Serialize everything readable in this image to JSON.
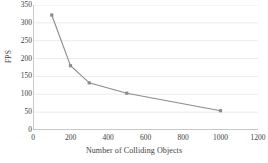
{
  "chart_data": {
    "type": "line",
    "title": "",
    "xlabel": "Number of Colliding Objects",
    "ylabel": "FPS",
    "x": [
      100,
      200,
      300,
      500,
      1000
    ],
    "values": [
      322,
      180,
      132,
      103,
      54
    ],
    "series": [
      {
        "name": "FPS",
        "x": [
          100,
          200,
          300,
          500,
          1000
        ],
        "values": [
          322,
          180,
          132,
          103,
          54
        ]
      }
    ],
    "xlim": [
      0,
      1200
    ],
    "ylim": [
      0,
      350
    ],
    "xticks": [
      0,
      200,
      400,
      600,
      800,
      1000,
      1200
    ],
    "yticks": [
      0,
      50,
      100,
      150,
      200,
      250,
      300,
      350
    ],
    "xtick_labels": [
      "0",
      "200",
      "400",
      "600",
      "800",
      "1000",
      "1200"
    ],
    "ytick_labels": [
      "0",
      "50",
      "100",
      "150",
      "200",
      "250",
      "300",
      "350"
    ],
    "grid": "horizontal",
    "legend": "none",
    "marker": "square",
    "line_color": "#8c8c8c",
    "marker_color": "#8c8c8c",
    "grid_color": "#e3e3e3",
    "axis_color": "#b3b3b3",
    "text_color": "#3d3d3d",
    "background": "#ffffff"
  }
}
